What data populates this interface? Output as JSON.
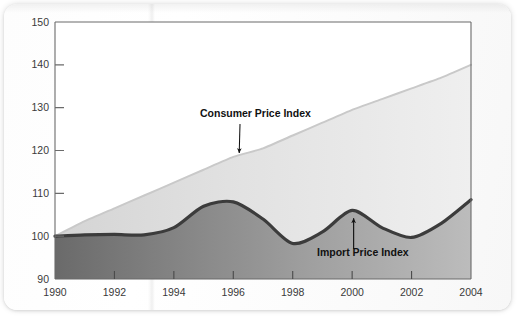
{
  "chart_data": {
    "type": "area",
    "title": "",
    "subtitle": "",
    "xlabel": "",
    "ylabel": "",
    "xlim": [
      1990,
      2004
    ],
    "ylim": [
      90,
      150
    ],
    "grid": false,
    "legend_position": "inline-annotations",
    "x_ticks": [
      "1990",
      "1992",
      "1994",
      "1996",
      "1998",
      "2000",
      "2002",
      "2004"
    ],
    "x_tick_values": [
      1990,
      1992,
      1994,
      1996,
      1998,
      2000,
      2002,
      2004
    ],
    "y_ticks": [
      "90",
      "100",
      "110",
      "120",
      "130",
      "140",
      "150"
    ],
    "y_tick_values": [
      90,
      100,
      110,
      120,
      130,
      140,
      150
    ],
    "x": [
      1990,
      1991,
      1992,
      1993,
      1994,
      1995,
      1996,
      1997,
      1998,
      1999,
      2000,
      2001,
      2002,
      2003,
      2004
    ],
    "series": [
      {
        "name": "Consumer Price Index",
        "values": [
          100.0,
          103.5,
          106.5,
          109.5,
          112.5,
          115.5,
          118.5,
          120.5,
          123.5,
          126.5,
          129.5,
          132.0,
          134.5,
          137.0,
          140.0
        ],
        "color": "#c9c9c9",
        "fill_color_start": "#d8d8d8",
        "fill_color_end": "#ececec",
        "line_width": 2.0
      },
      {
        "name": "Import Price Index",
        "values": [
          100.0,
          100.3,
          100.4,
          100.3,
          102.0,
          107.0,
          108.0,
          104.0,
          98.3,
          101.0,
          106.0,
          102.0,
          99.7,
          103.0,
          108.5
        ],
        "color": "#3c3c3c",
        "fill_color_start": "#6e6e6e",
        "fill_color_end": "#b4b4b4",
        "line_width": 3.2
      }
    ],
    "annotations": [
      {
        "label": "Consumer Price Index",
        "arrow": "diagonal-down-left",
        "points_to_series": "Consumer Price Index",
        "points_to_x": 1996.2,
        "points_to_y": 119.4
      },
      {
        "label": "Import Price Index",
        "arrow": "vertical-up",
        "points_to_series": "Import Price Index",
        "points_to_x": 2000.05,
        "points_to_y": 105.6
      }
    ]
  }
}
